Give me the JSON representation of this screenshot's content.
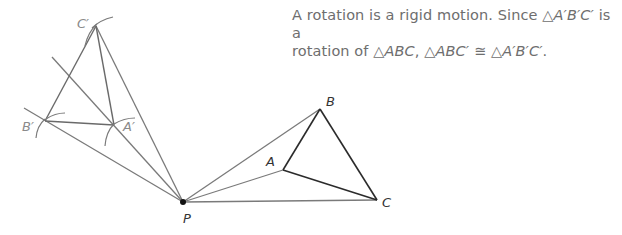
{
  "caption": {
    "line1_a": "A rotation is a rigid motion. Since ",
    "line1_tri": "△",
    "line1_math": "A′B′C′",
    "line1_b": " is a",
    "line2_a": "rotation of ",
    "line2_tri1": "△",
    "line2_math1": "ABC",
    "line2_sep": ", ",
    "line2_tri2": "△",
    "line2_math2": "ABC′",
    "line2_cong": " ≅ ",
    "line2_tri3": "△",
    "line2_math3": "A′B′C′",
    "line2_end": "."
  },
  "labels": {
    "P": "P",
    "A": "A",
    "B": "B",
    "C": "C",
    "A_prime": "A′",
    "B_prime": "B′",
    "C_prime": "C′"
  },
  "colors": {
    "original_triangle": "#2b2b2b",
    "construction": "#7a7a7a",
    "image_triangle": "#6a6a6a",
    "center_point": "#111111",
    "caption_text": "#6e6e6e"
  }
}
